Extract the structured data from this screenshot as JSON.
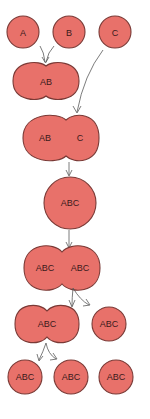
{
  "diagram": {
    "type": "cell-fusion-and-division",
    "colors": {
      "cell_fill": "#e8716a",
      "cell_stroke": "#7a3a36",
      "label": "#3a1a1a",
      "arrow": "#5a5a5a"
    },
    "stages": [
      {
        "id": "cells-initial",
        "labels": [
          "A",
          "B",
          "C"
        ]
      },
      {
        "id": "fusion-ab",
        "labels": [
          "AB"
        ]
      },
      {
        "id": "fusion-ab-c",
        "labels": [
          "AB",
          "C"
        ]
      },
      {
        "id": "fused-abc",
        "labels": [
          "ABC"
        ]
      },
      {
        "id": "dividing-abc",
        "labels": [
          "ABC",
          "ABC"
        ]
      },
      {
        "id": "divided-second",
        "labels": [
          "ABC",
          "ABC"
        ]
      },
      {
        "id": "daughters-final",
        "labels": [
          "ABC",
          "ABC",
          "ABC"
        ]
      }
    ]
  }
}
